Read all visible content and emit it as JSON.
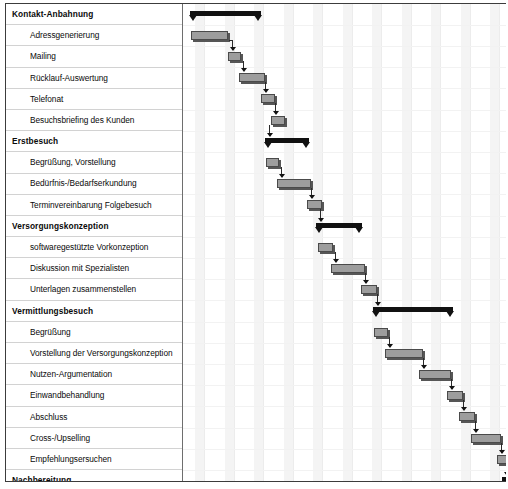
{
  "chart_data": {
    "type": "bar",
    "chart_kind": "gantt",
    "title": "",
    "xlabel": "",
    "ylabel": "",
    "grid": true,
    "legend_position": "none",
    "timeline_units": "relative",
    "timeline_span_px": 324,
    "categories": [
      "Kontakt-Anbahnung",
      "Adressgenerierung",
      "Mailing",
      "Rücklauf-Auswertung",
      "Telefonat",
      "Besuchsbriefing des Kunden",
      "Erstbesuch",
      "Begrüßung, Vorstellung",
      "Bedürfnis-/Bedarfserkundung",
      "Terminvereinbarung Folgebesuch",
      "Versorgungskonzeption",
      "softwaregestützte Vorkonzeption",
      "Diskussion mit Spezialisten",
      "Unterlagen zusammenstellen",
      "Vermittlungsbesuch",
      "Begrüßung",
      "Vorstellung der Versorgungskonzeption",
      "Nutzen-Argumentation",
      "Einwandbehandlung",
      "Abschluss",
      "Cross-/Upselling",
      "Empfehlungsersuchen",
      "Nachbereitung",
      "Datenübermittlung an Produktgeber",
      "Überwachung Policierung",
      "Abschlussbestätigung beim Kunden",
      "Betreuung",
      "Bedarfs- und Zufriedenheitsmonitoring",
      "Regulierung"
    ],
    "rows": [
      {
        "label": "Kontakt-Anbahnung",
        "type": "summary",
        "start": 7,
        "end": 78
      },
      {
        "label": "Adressgenerierung",
        "type": "task",
        "start": 8,
        "end": 45
      },
      {
        "label": "Mailing",
        "type": "task",
        "start": 45,
        "end": 58
      },
      {
        "label": "Rücklauf-Auswertung",
        "type": "task",
        "start": 56,
        "end": 82
      },
      {
        "label": "Telefonat",
        "type": "task",
        "start": 78,
        "end": 92
      },
      {
        "label": "Besuchsbriefing des Kunden",
        "type": "task",
        "start": 88,
        "end": 102
      },
      {
        "label": "Erstbesuch",
        "type": "summary",
        "start": 82,
        "end": 126
      },
      {
        "label": "Begrüßung, Vorstellung",
        "type": "task",
        "start": 83,
        "end": 96
      },
      {
        "label": "Bedürfnis-/Bedarfserkundung",
        "type": "task",
        "start": 94,
        "end": 128
      },
      {
        "label": "Terminvereinbarung Folgebesuch",
        "type": "task",
        "start": 124,
        "end": 139
      },
      {
        "label": "Versorgungskonzeption",
        "type": "summary",
        "start": 133,
        "end": 179
      },
      {
        "label": "softwaregestützte Vorkonzeption",
        "type": "task",
        "start": 135,
        "end": 150
      },
      {
        "label": "Diskussion mit Spezialisten",
        "type": "task",
        "start": 148,
        "end": 182
      },
      {
        "label": "Unterlagen zusammenstellen",
        "type": "task",
        "start": 178,
        "end": 194
      },
      {
        "label": "Vermittlungsbesuch",
        "type": "summary",
        "start": 190,
        "end": 270
      },
      {
        "label": "Begrüßung",
        "type": "task",
        "start": 191,
        "end": 205
      },
      {
        "label": "Vorstellung der Versorgungskonzeption",
        "type": "task",
        "start": 202,
        "end": 240
      },
      {
        "label": "Nutzen-Argumentation",
        "type": "task",
        "start": 236,
        "end": 268
      },
      {
        "label": "Einwandbehandlung",
        "type": "task",
        "start": 264,
        "end": 280
      },
      {
        "label": "Abschluss",
        "type": "task",
        "start": 276,
        "end": 292
      },
      {
        "label": "Cross-/Upselling",
        "type": "task",
        "start": 288,
        "end": 318
      },
      {
        "label": "Empfehlungsersuchen",
        "type": "task",
        "start": 314,
        "end": 330
      },
      {
        "label": "Nachbereitung",
        "type": "summary",
        "start": 319,
        "end": 365
      },
      {
        "label": "Datenübermittlung an Produktgeber",
        "type": "task",
        "start": 321,
        "end": 336
      },
      {
        "label": "Überwachung Policierung",
        "type": "task",
        "start": 333,
        "end": 368
      },
      {
        "label": "Abschlussbestätigung beim Kunden",
        "type": "task",
        "start": 364,
        "end": 380
      },
      {
        "label": "Betreuung",
        "type": "summary",
        "start": 374,
        "end": 331
      },
      {
        "label": "Bedarfs- und Zufriedenheitsmonitoring",
        "type": "task",
        "start": 376,
        "end": 331
      },
      {
        "label": "Regulierung",
        "type": "task",
        "start": 400,
        "end": 331
      }
    ],
    "colors": {
      "summary_bar": "#111111",
      "task_bar": "#9d9d9d",
      "task_bar_border": "#4a4a4a",
      "task_bar_shadow": "#565656",
      "grid_band": "#f4f4f4",
      "row_separator": "#d2d2d2",
      "frame_border": "#3c3c3c",
      "text": "#0a0a0a"
    }
  }
}
